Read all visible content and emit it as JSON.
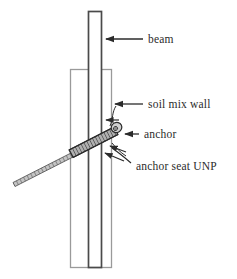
{
  "figure": {
    "type": "engineering-cross-section-diagram",
    "background_color": "#ffffff"
  },
  "labels": [
    {
      "id": "beam",
      "text": "beam",
      "x": 148,
      "y": 43
    },
    {
      "id": "soil-mix-wall",
      "text": "soil mix wall",
      "x": 148,
      "y": 108
    },
    {
      "id": "anchor",
      "text": "anchor",
      "x": 143,
      "y": 138
    },
    {
      "id": "anchor-seat-unp",
      "text": "anchor seat UNP",
      "x": 136,
      "y": 170
    }
  ],
  "components": {
    "beam": {
      "name": "beam",
      "shape": "vertical-rectangle",
      "x": 88,
      "y": 11,
      "width": 14,
      "height": 257,
      "fill": "#ffffff",
      "stroke": "#4a4a4a"
    },
    "soil_mix_wall": {
      "name": "soil mix wall",
      "shape": "vertical-rectangle",
      "x": 70,
      "y": 69,
      "width": 42,
      "height": 199,
      "fill": "#ffffff",
      "stroke": "#9a9a9a"
    },
    "anchor_rod": {
      "name": "anchor",
      "shape": "diagonal-hatched-rod",
      "from_x": 13,
      "from_y": 180,
      "to_x": 118,
      "to_y": 128,
      "thin_width": 4,
      "thick_width": 13,
      "fill": "#b8b8b8",
      "stroke": "#333333"
    },
    "anchor_head": {
      "name": "anchor head nut",
      "shape": "ellipse",
      "cx": 118,
      "cy": 128,
      "rx": 5,
      "ry": 5,
      "fill": "#cfcfcf",
      "stroke": "#2b2b2b"
    },
    "anchor_seat": {
      "name": "anchor seat UNP",
      "shape": "thickened-rod-section",
      "note": "hatched thickened band where rod crosses the wall"
    }
  },
  "leaders": {
    "stroke": "#2b2b2b",
    "beam": {
      "tip_x": 103,
      "tip_y": 39,
      "end_x": 143,
      "end_y": 39
    },
    "soil_mix_wall": {
      "tip_x": 112,
      "tip_y": 104,
      "end_x": 143,
      "end_y": 104
    },
    "anchor": {
      "tip_x": 122,
      "tip_y": 134,
      "end_x": 138,
      "end_y": 134
    },
    "anchor_seat": {
      "tip_x": 110,
      "tip_y": 150,
      "end_x": 131,
      "end_y": 163
    }
  },
  "colors": {
    "ink": "#2b2b2b",
    "beam_stroke": "#4a4a4a",
    "wall_stroke": "#9a9a9a",
    "rod_fill": "#b8b8b8",
    "paper": "#ffffff"
  }
}
